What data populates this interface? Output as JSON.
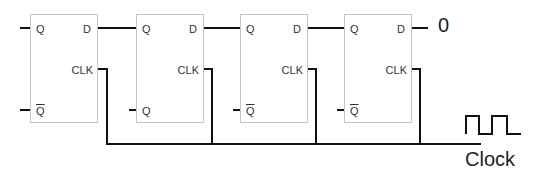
{
  "diagram": {
    "type": "shift-register",
    "wire_color": "#111111",
    "box_border_color": "#c4c4c4",
    "flip_flops": [
      {
        "q": "Q",
        "d": "D",
        "clk": "CLK",
        "qbar": "Q",
        "qbar_overline": true
      },
      {
        "q": "Q",
        "d": "D",
        "clk": "CLK",
        "qbar": "Q",
        "qbar_overline": false
      },
      {
        "q": "Q",
        "d": "D",
        "clk": "CLK",
        "qbar": "Q",
        "qbar_overline": true
      },
      {
        "q": "Q",
        "d": "D",
        "clk": "CLK",
        "qbar": "Q",
        "qbar_overline": true
      }
    ],
    "input_value": "0",
    "clock_label": "Clock",
    "clock_icon": "square-wave-icon"
  }
}
